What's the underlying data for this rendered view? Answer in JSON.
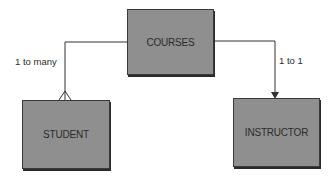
{
  "diagram": {
    "entities": [
      {
        "id": "courses",
        "label": "COURSES"
      },
      {
        "id": "student",
        "label": "STUDENT"
      },
      {
        "id": "instructor",
        "label": "INSTRUCTOR"
      }
    ],
    "relationships": [
      {
        "from": "courses",
        "to": "student",
        "label": "1 to many",
        "end": "crows-foot"
      },
      {
        "from": "courses",
        "to": "instructor",
        "label": "1 to 1",
        "end": "arrow"
      }
    ],
    "colors": {
      "box_fill": "#8f8f8f",
      "line": "#333333",
      "text": "#2b2b2b"
    }
  }
}
